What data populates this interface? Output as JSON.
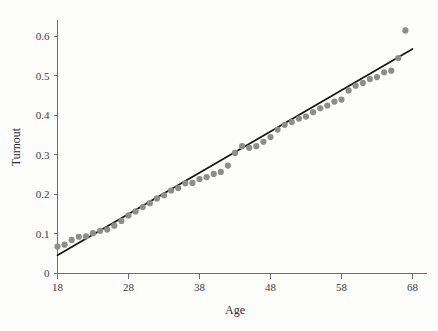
{
  "chart_data": {
    "type": "scatter",
    "title": "",
    "xlabel": "Age",
    "ylabel": "Turnout",
    "xlim": [
      18,
      68
    ],
    "ylim": [
      0,
      0.64
    ],
    "grid": false,
    "legend": null,
    "x_ticks": [
      18,
      28,
      38,
      48,
      58,
      68
    ],
    "x_tick_labels": [
      "18",
      "28",
      "38",
      "48",
      "58",
      "68"
    ],
    "y_ticks": [
      0,
      0.1,
      0.2,
      0.3,
      0.4,
      0.5,
      0.6
    ],
    "y_tick_labels": [
      "0",
      "0.1",
      "0.2",
      "0.3",
      "0.4",
      "0.5",
      "0.6"
    ],
    "point_color": "#8d8d8d",
    "line_color": "#151515",
    "background_color": "#fdfdfb",
    "series": [
      {
        "name": "Observed turnout by age",
        "type": "scatter",
        "marker_size": 3.1,
        "x": [
          18,
          19,
          20,
          21,
          22,
          23,
          24,
          25,
          26,
          27,
          28,
          29,
          30,
          31,
          32,
          33,
          34,
          35,
          36,
          37,
          38,
          39,
          40,
          41,
          42,
          43,
          44,
          45,
          46,
          47,
          48,
          49,
          50,
          51,
          52,
          53,
          54,
          55,
          56,
          57,
          58,
          59,
          60,
          61,
          62,
          63,
          64,
          65,
          66,
          67
        ],
        "y": [
          0.068,
          0.073,
          0.085,
          0.093,
          0.094,
          0.102,
          0.108,
          0.111,
          0.121,
          0.133,
          0.147,
          0.157,
          0.168,
          0.178,
          0.19,
          0.198,
          0.21,
          0.216,
          0.228,
          0.229,
          0.239,
          0.244,
          0.252,
          0.257,
          0.273,
          0.305,
          0.322,
          0.318,
          0.322,
          0.333,
          0.345,
          0.364,
          0.376,
          0.383,
          0.392,
          0.397,
          0.408,
          0.418,
          0.425,
          0.435,
          0.44,
          0.463,
          0.475,
          0.482,
          0.492,
          0.497,
          0.509,
          0.513,
          0.545,
          0.615
        ]
      },
      {
        "name": "Linear fit",
        "type": "line",
        "x": [
          18,
          68
        ],
        "y": [
          0.046,
          0.568
        ]
      }
    ]
  }
}
